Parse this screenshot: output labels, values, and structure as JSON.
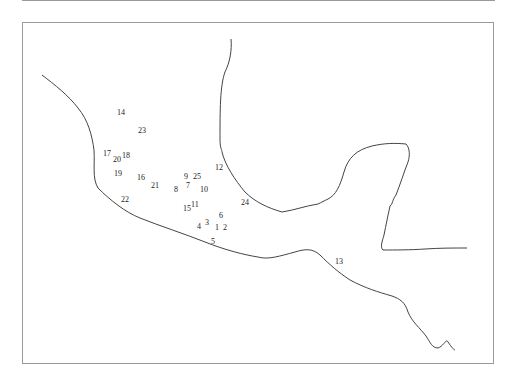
{
  "map": {
    "type": "station-location map (coastline)",
    "frame_color": "#9a9a9a",
    "line_color": "#444444",
    "stations": [
      {
        "id": "1",
        "x": 218,
        "y": 228
      },
      {
        "id": "2",
        "x": 226,
        "y": 228
      },
      {
        "id": "3",
        "x": 208,
        "y": 223
      },
      {
        "id": "4",
        "x": 200,
        "y": 227
      },
      {
        "id": "5",
        "x": 214,
        "y": 242
      },
      {
        "id": "6",
        "x": 222,
        "y": 216
      },
      {
        "id": "7",
        "x": 189,
        "y": 186
      },
      {
        "id": "8",
        "x": 177,
        "y": 190
      },
      {
        "id": "9",
        "x": 187,
        "y": 177
      },
      {
        "id": "10",
        "x": 203,
        "y": 190
      },
      {
        "id": "11",
        "x": 194,
        "y": 205
      },
      {
        "id": "12",
        "x": 218,
        "y": 168
      },
      {
        "id": "13",
        "x": 338,
        "y": 262
      },
      {
        "id": "14",
        "x": 120,
        "y": 113
      },
      {
        "id": "15",
        "x": 186,
        "y": 209
      },
      {
        "id": "16",
        "x": 140,
        "y": 178
      },
      {
        "id": "17",
        "x": 106,
        "y": 154
      },
      {
        "id": "18",
        "x": 125,
        "y": 156
      },
      {
        "id": "19",
        "x": 117,
        "y": 174
      },
      {
        "id": "20",
        "x": 116,
        "y": 160
      },
      {
        "id": "21",
        "x": 154,
        "y": 186
      },
      {
        "id": "22",
        "x": 124,
        "y": 200
      },
      {
        "id": "23",
        "x": 141,
        "y": 131
      },
      {
        "id": "24",
        "x": 244,
        "y": 203
      },
      {
        "id": "25",
        "x": 196,
        "y": 177
      }
    ]
  }
}
